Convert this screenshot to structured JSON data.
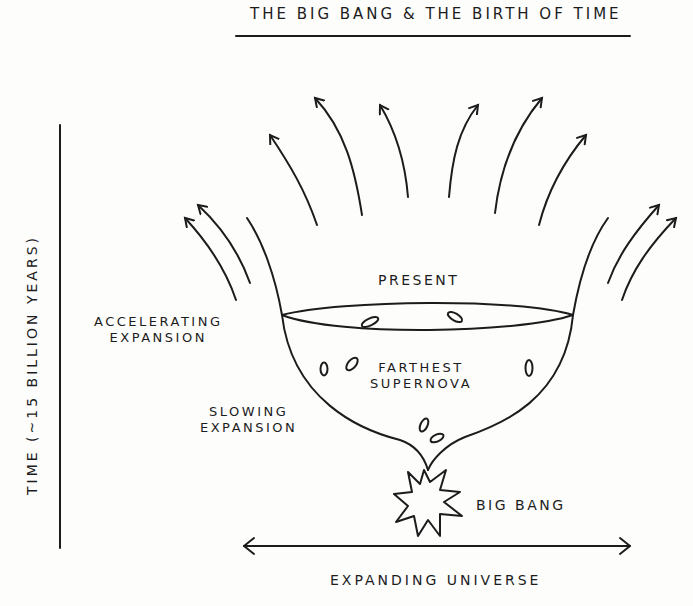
{
  "diagram": {
    "title": "The Big Bang & the Birth of Time",
    "axes": {
      "y_label": "Time (~15 billion years)",
      "x_label": "Expanding Universe"
    },
    "regions": {
      "present": "Present",
      "accelerating": [
        "Accelerating",
        "Expansion"
      ],
      "slowing": [
        "Slowing",
        "Expansion"
      ],
      "farthest_supernova": [
        "Farthest",
        "Supernova"
      ],
      "origin": "Big Bang"
    },
    "elements": {
      "outward_arrows_count": 12,
      "supernova_markers_count": 8
    },
    "colors": {
      "ink": "#1c1c1c",
      "paper": "#fdfdfc"
    }
  }
}
